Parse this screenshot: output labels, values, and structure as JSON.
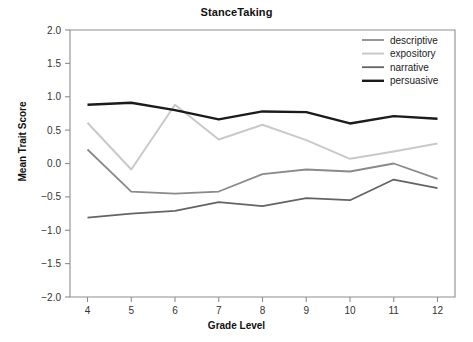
{
  "chart_data": {
    "type": "line",
    "title": "StanceTaking",
    "xlabel": "Grade Level",
    "ylabel": "Mean Trait Score",
    "x": [
      4,
      5,
      6,
      7,
      8,
      9,
      10,
      11,
      12
    ],
    "categories": [
      "4",
      "5",
      "6",
      "7",
      "8",
      "9",
      "10",
      "11",
      "12"
    ],
    "xlim": [
      3.6,
      12.4
    ],
    "ylim": [
      -2.0,
      2.0
    ],
    "yticks": [
      -2.0,
      -1.5,
      -1.0,
      -0.5,
      0.0,
      0.5,
      1.0,
      1.5,
      2.0
    ],
    "ytick_labels": [
      "−2.0",
      "−1.5",
      "−1.0",
      "−0.5",
      "0.0",
      "0.5",
      "1.0",
      "1.5",
      "2.0"
    ],
    "grid": false,
    "legend_position": "upper right",
    "series": [
      {
        "name": "descriptive",
        "color": "#8a8a8a",
        "width": 1.8,
        "values": [
          0.21,
          -0.42,
          -0.45,
          -0.42,
          -0.16,
          -0.09,
          -0.12,
          0.0,
          -0.23
        ]
      },
      {
        "name": "expository",
        "color": "#c9c9c9",
        "width": 2.0,
        "values": [
          0.61,
          -0.09,
          0.88,
          0.36,
          0.58,
          0.35,
          0.07,
          0.18,
          0.3
        ]
      },
      {
        "name": "narrative",
        "color": "#646464",
        "width": 1.8,
        "values": [
          -0.81,
          -0.75,
          -0.71,
          -0.58,
          -0.64,
          -0.52,
          -0.55,
          -0.24,
          -0.37
        ]
      },
      {
        "name": "persuasive",
        "color": "#1b1b1b",
        "width": 2.4,
        "values": [
          0.88,
          0.91,
          0.8,
          0.66,
          0.78,
          0.77,
          0.6,
          0.71,
          0.67
        ]
      }
    ]
  },
  "legend": {
    "entries": [
      {
        "label": "descriptive"
      },
      {
        "label": "expository"
      },
      {
        "label": "narrative"
      },
      {
        "label": "persuasive"
      }
    ]
  },
  "axes": {
    "frame_color": "#8d8d8d"
  }
}
